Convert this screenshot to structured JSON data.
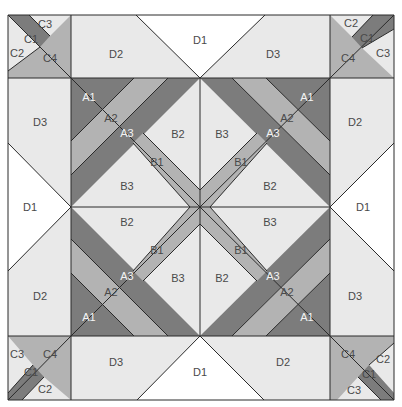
{
  "colors": {
    "dark": "#7c7c7c",
    "medium": "#b3b3b3",
    "light": "#e9e9e9",
    "white": "#ffffff",
    "line": "#2a2a2a"
  },
  "geometry": {
    "outer": [
      8,
      15,
      394,
      400
    ],
    "inner": [
      71,
      78,
      330,
      336
    ],
    "center": [
      200,
      207
    ]
  },
  "pieces": [
    {
      "id": "tl-c-bg",
      "fill": "medium",
      "pts": "8,15 71,15 71,78 8,78"
    },
    {
      "id": "tl-c3",
      "fill": "light",
      "pts": "29,15 71,15 50,36"
    },
    {
      "id": "tl-c1",
      "fill": "dark",
      "pts": "8,15 29,15 50,36 40,47"
    },
    {
      "id": "tl-c2",
      "fill": "light",
      "pts": "8,15 40,47 8,71"
    },
    {
      "id": "tl-c2b",
      "fill": "light",
      "pts": "8,15 8,29"
    },
    {
      "id": "tr-c-bg",
      "fill": "medium",
      "pts": "330,15 394,15 394,78 330,78"
    },
    {
      "id": "tr-c2",
      "fill": "light",
      "pts": "330,15 373,15 352,37"
    },
    {
      "id": "tr-c1",
      "fill": "dark",
      "pts": "373,15 394,15 394,29 362,48 352,37"
    },
    {
      "id": "tr-c3",
      "fill": "light",
      "pts": "394,29 394,78 362,48"
    },
    {
      "id": "bl-c-bg",
      "fill": "medium",
      "pts": "8,336 71,336 71,400 8,400"
    },
    {
      "id": "bl-c3",
      "fill": "light",
      "pts": "8,336 8,393 33,365"
    },
    {
      "id": "bl-c1",
      "fill": "dark",
      "pts": "8,393 8,400 22,400 44,377 33,365"
    },
    {
      "id": "bl-c2",
      "fill": "light",
      "pts": "22,400 71,400 44,377"
    },
    {
      "id": "br-c-bg",
      "fill": "medium",
      "pts": "330,336 394,336 394,400 330,400"
    },
    {
      "id": "br-c2",
      "fill": "light",
      "pts": "394,343 394,393 369,365"
    },
    {
      "id": "br-c1",
      "fill": "dark",
      "pts": "369,365 394,393 394,400 381,400 358,377"
    },
    {
      "id": "br-c3",
      "fill": "light",
      "pts": "337,400 381,400 358,377"
    },
    {
      "id": "top-d2",
      "fill": "light",
      "pts": "71,15 136,15 200,78 71,78"
    },
    {
      "id": "top-d1",
      "fill": "white",
      "pts": "136,15 265,15 200,78"
    },
    {
      "id": "top-d3",
      "fill": "light",
      "pts": "265,15 330,15 330,78 200,78"
    },
    {
      "id": "bot-d3",
      "fill": "light",
      "pts": "71,336 200,336 137,400 71,400"
    },
    {
      "id": "bot-d1",
      "fill": "white",
      "pts": "200,336 264,400 137,400"
    },
    {
      "id": "bot-d2",
      "fill": "light",
      "pts": "200,336 330,336 330,400 264,400"
    },
    {
      "id": "left-d3",
      "fill": "light",
      "pts": "8,78 71,78 71,207 8,143"
    },
    {
      "id": "left-d1",
      "fill": "white",
      "pts": "8,143 71,207 8,271"
    },
    {
      "id": "left-d2",
      "fill": "light",
      "pts": "8,271 71,207 71,336 8,336"
    },
    {
      "id": "right-d2",
      "fill": "light",
      "pts": "330,78 394,78 394,143 330,207"
    },
    {
      "id": "right-d1",
      "fill": "white",
      "pts": "394,143 394,271 330,207"
    },
    {
      "id": "right-d3",
      "fill": "light",
      "pts": "330,207 394,271 394,336 330,336"
    },
    {
      "id": "q1-bg",
      "fill": "light",
      "pts": "71,78 200,78 200,207 71,207"
    },
    {
      "id": "q1-a3",
      "fill": "dark",
      "pts": "168,78 200,78 71,207 71,175"
    },
    {
      "id": "q1-a2",
      "fill": "medium",
      "pts": "134,78 168,78 71,175 71,141"
    },
    {
      "id": "q1-a1",
      "fill": "dark",
      "pts": "71,78 134,78 71,141"
    },
    {
      "id": "q1-b1",
      "fill": "medium",
      "pts": "133,143 143,133 200,190 200,207 190,207"
    },
    {
      "id": "q2-bg",
      "fill": "light",
      "pts": "200,78 330,78 330,207 200,207"
    },
    {
      "id": "q2-a3",
      "fill": "dark",
      "pts": "200,78 232,78 330,175 330,207"
    },
    {
      "id": "q2-a2",
      "fill": "medium",
      "pts": "232,78 266,78 330,141 330,175"
    },
    {
      "id": "q2-a1",
      "fill": "dark",
      "pts": "266,78 330,78 330,141"
    },
    {
      "id": "q2-b1",
      "fill": "medium",
      "pts": "257,133 267,143 210,207 200,207 200,190"
    },
    {
      "id": "q3-bg",
      "fill": "light",
      "pts": "71,207 200,207 200,336 71,336"
    },
    {
      "id": "q3-a3",
      "fill": "dark",
      "pts": "71,207 200,336 168,336 71,239"
    },
    {
      "id": "q3-a2",
      "fill": "medium",
      "pts": "71,239 168,336 134,336 71,273"
    },
    {
      "id": "q3-a1",
      "fill": "dark",
      "pts": "71,273 134,336 71,336"
    },
    {
      "id": "q3-b1",
      "fill": "medium",
      "pts": "190,207 200,207 200,224 143,281 133,271"
    },
    {
      "id": "q4-bg",
      "fill": "light",
      "pts": "200,207 330,207 330,336 200,336"
    },
    {
      "id": "q4-a3",
      "fill": "dark",
      "pts": "330,207 330,239 232,336 200,336"
    },
    {
      "id": "q4-a2",
      "fill": "medium",
      "pts": "330,239 330,273 266,336 232,336"
    },
    {
      "id": "q4-a1",
      "fill": "dark",
      "pts": "330,273 330,336 266,336"
    },
    {
      "id": "q4-b1",
      "fill": "medium",
      "pts": "200,207 210,207 267,271 257,281 200,224"
    }
  ],
  "lines": [
    "8,15 394,15 394,400 8,400 8,15",
    "71,15 71,400",
    "330,15 330,400",
    "8,78 394,78",
    "8,336 394,336",
    "200,78 200,336",
    "71,207 330,207",
    "136,15 200,78 265,15",
    "137,400 200,336 264,400",
    "8,143 71,207 8,271",
    "394,143 330,207 394,271",
    "71,78 200,207 330,78",
    "71,336 200,207 330,336",
    "134,78 71,141",
    "168,78 71,175",
    "266,78 330,141",
    "232,78 330,175",
    "71,273 134,336",
    "71,239 168,336",
    "330,273 266,336",
    "330,239 232,336",
    "133,143 190,207",
    "143,133 200,190",
    "267,143 210,207",
    "257,133 200,190",
    "133,271 190,207",
    "143,281 200,224",
    "267,271 210,207",
    "257,281 200,224",
    "8,15 71,78",
    "29,15 50,36",
    "40,47 8,71",
    "8,15 8,15",
    "394,15 330,78",
    "373,15 352,37",
    "394,29 362,48",
    "8,400 71,336",
    "33,365 8,393",
    "44,377 22,400",
    "330,336 394,400",
    "369,365 394,343",
    "358,377 381,400"
  ],
  "labels": [
    {
      "text": "C3",
      "x": 45,
      "y": 24,
      "tone": "light"
    },
    {
      "text": "C1",
      "x": 31,
      "y": 39,
      "tone": "light"
    },
    {
      "text": "C2",
      "x": 17,
      "y": 53,
      "tone": "light"
    },
    {
      "text": "C4",
      "x": 50,
      "y": 58,
      "tone": "light"
    },
    {
      "text": "D2",
      "x": 116,
      "y": 54,
      "tone": "light"
    },
    {
      "text": "D1",
      "x": 200,
      "y": 40,
      "tone": "light"
    },
    {
      "text": "D3",
      "x": 273,
      "y": 54,
      "tone": "light"
    },
    {
      "text": "C2",
      "x": 351,
      "y": 23,
      "tone": "light"
    },
    {
      "text": "C1",
      "x": 367,
      "y": 38,
      "tone": "light"
    },
    {
      "text": "C3",
      "x": 383,
      "y": 53,
      "tone": "light"
    },
    {
      "text": "C4",
      "x": 348,
      "y": 58,
      "tone": "light"
    },
    {
      "text": "D3",
      "x": 40,
      "y": 122,
      "tone": "light"
    },
    {
      "text": "D1",
      "x": 30,
      "y": 207,
      "tone": "light"
    },
    {
      "text": "D2",
      "x": 40,
      "y": 296,
      "tone": "light"
    },
    {
      "text": "D2",
      "x": 355,
      "y": 122,
      "tone": "light"
    },
    {
      "text": "D1",
      "x": 363,
      "y": 207,
      "tone": "light"
    },
    {
      "text": "D3",
      "x": 355,
      "y": 296,
      "tone": "light"
    },
    {
      "text": "A1",
      "x": 89,
      "y": 97,
      "tone": "dark"
    },
    {
      "text": "A2",
      "x": 111,
      "y": 118,
      "tone": "light"
    },
    {
      "text": "A3",
      "x": 127,
      "y": 133,
      "tone": "dark"
    },
    {
      "text": "B2",
      "x": 178,
      "y": 134,
      "tone": "light"
    },
    {
      "text": "B1",
      "x": 157,
      "y": 162,
      "tone": "light"
    },
    {
      "text": "B3",
      "x": 127,
      "y": 186,
      "tone": "light"
    },
    {
      "text": "B3",
      "x": 222,
      "y": 134,
      "tone": "light"
    },
    {
      "text": "A3",
      "x": 273,
      "y": 133,
      "tone": "dark"
    },
    {
      "text": "A2",
      "x": 287,
      "y": 118,
      "tone": "light"
    },
    {
      "text": "A1",
      "x": 307,
      "y": 97,
      "tone": "dark"
    },
    {
      "text": "B1",
      "x": 241,
      "y": 162,
      "tone": "light"
    },
    {
      "text": "B2",
      "x": 270,
      "y": 186,
      "tone": "light"
    },
    {
      "text": "B2",
      "x": 127,
      "y": 222,
      "tone": "light"
    },
    {
      "text": "B1",
      "x": 157,
      "y": 250,
      "tone": "light"
    },
    {
      "text": "A3",
      "x": 127,
      "y": 276,
      "tone": "dark"
    },
    {
      "text": "B3",
      "x": 178,
      "y": 278,
      "tone": "light"
    },
    {
      "text": "A2",
      "x": 111,
      "y": 292,
      "tone": "light"
    },
    {
      "text": "A1",
      "x": 89,
      "y": 317,
      "tone": "dark"
    },
    {
      "text": "B3",
      "x": 270,
      "y": 222,
      "tone": "light"
    },
    {
      "text": "B1",
      "x": 241,
      "y": 250,
      "tone": "light"
    },
    {
      "text": "B2",
      "x": 222,
      "y": 278,
      "tone": "light"
    },
    {
      "text": "A3",
      "x": 273,
      "y": 276,
      "tone": "dark"
    },
    {
      "text": "A2",
      "x": 287,
      "y": 292,
      "tone": "light"
    },
    {
      "text": "A1",
      "x": 307,
      "y": 317,
      "tone": "dark"
    },
    {
      "text": "C3",
      "x": 17,
      "y": 354,
      "tone": "light"
    },
    {
      "text": "C4",
      "x": 50,
      "y": 354,
      "tone": "light"
    },
    {
      "text": "C1",
      "x": 31,
      "y": 372,
      "tone": "light"
    },
    {
      "text": "C2",
      "x": 45,
      "y": 389,
      "tone": "light"
    },
    {
      "text": "D3",
      "x": 116,
      "y": 362,
      "tone": "light"
    },
    {
      "text": "D1",
      "x": 200,
      "y": 372,
      "tone": "light"
    },
    {
      "text": "D2",
      "x": 283,
      "y": 362,
      "tone": "light"
    },
    {
      "text": "C4",
      "x": 348,
      "y": 354,
      "tone": "light"
    },
    {
      "text": "C2",
      "x": 383,
      "y": 359,
      "tone": "light"
    },
    {
      "text": "C1",
      "x": 369,
      "y": 374,
      "tone": "light"
    },
    {
      "text": "C3",
      "x": 354,
      "y": 390,
      "tone": "light"
    }
  ]
}
